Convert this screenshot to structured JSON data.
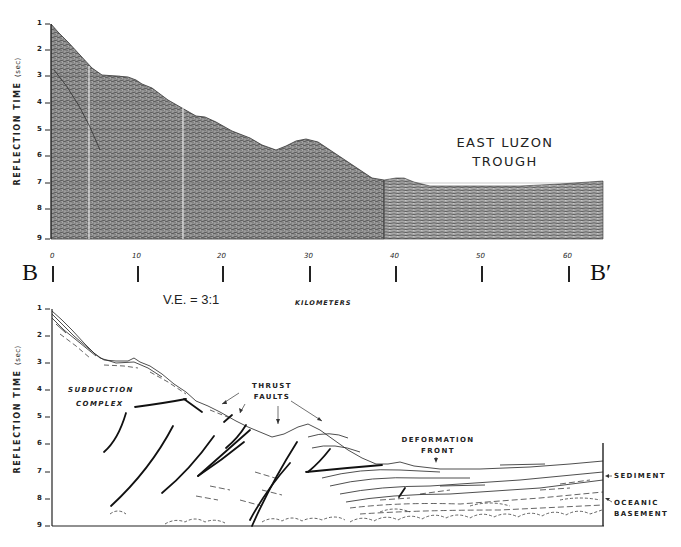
{
  "figure": {
    "section_start_label": "B",
    "section_end_label": "B′",
    "vertical_exaggeration": "V.E. = 3:1",
    "x_axis_label": "KILOMETERS",
    "x_ticks": [
      "0",
      "10",
      "20",
      "30",
      "40",
      "50",
      "60"
    ],
    "y_axis_label": "REFLECTION TIME",
    "y_axis_unit": "(sec)",
    "y_ticks": [
      "1",
      "2",
      "3",
      "4",
      "5",
      "6",
      "7",
      "8",
      "9"
    ]
  },
  "top_panel": {
    "title": "Seismic reflection profile",
    "annotation_line1": "EAST LUZON",
    "annotation_line2": "TROUGH"
  },
  "bottom_panel": {
    "title": "Line drawing interpretation",
    "labels": {
      "subduction_1": "SUBDUCTION",
      "subduction_2": "COMPLEX",
      "thrust_1": "THRUST",
      "thrust_2": "FAULTS",
      "deformation_1": "DEFORMATION",
      "deformation_2": "FRONT",
      "sediment": "SEDIMENT",
      "oceanic_1": "OCEANIC",
      "oceanic_2": "BASEMENT"
    }
  },
  "colors": {
    "ink": "#1a1a1a",
    "seismic_fill": "#8a8a8a",
    "background": "#ffffff"
  }
}
